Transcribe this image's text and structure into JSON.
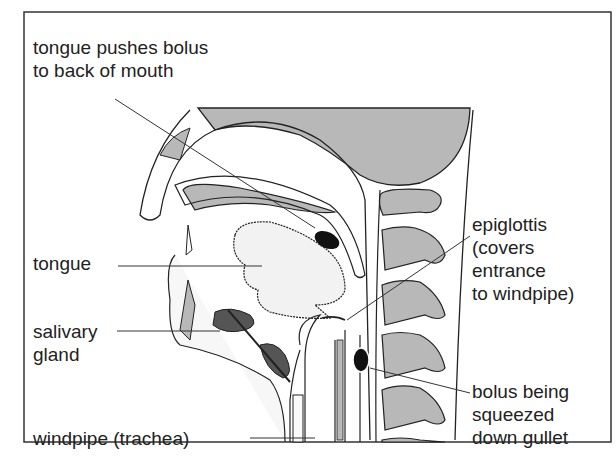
{
  "figure": {
    "type": "anatomical-diagram"
  },
  "labels": {
    "tongue_pushes": [
      "tongue pushes bolus",
      "to back of mouth"
    ],
    "tongue": "tongue",
    "salivary": [
      "salivary",
      "gland"
    ],
    "windpipe": "windpipe (trachea)",
    "epiglottis": [
      "epiglottis",
      "(covers",
      "entrance",
      "to windpipe)"
    ],
    "bolus": [
      "bolus being",
      "squeezed",
      "down gullet"
    ]
  },
  "colors": {
    "outline": "#222222",
    "tissue_gray": "#b8b8b8",
    "bolus_black": "#111111",
    "background": "#ffffff",
    "stipple": "#f2f2f2"
  }
}
